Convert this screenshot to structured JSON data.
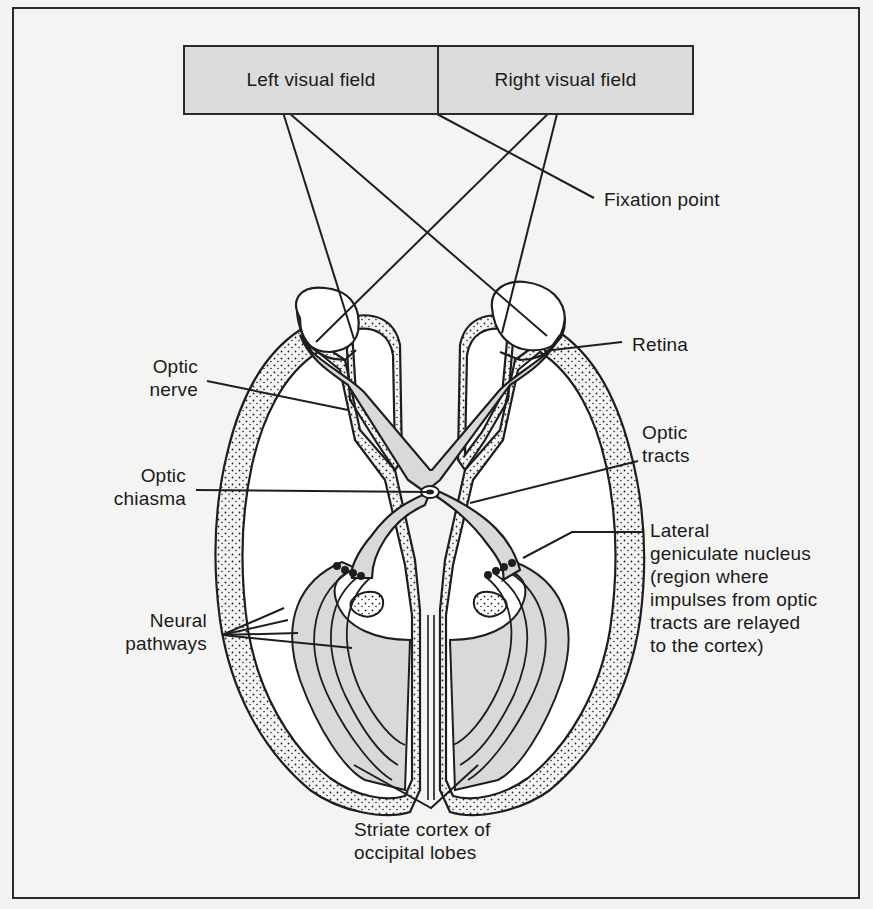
{
  "figure": {
    "visual_fields": {
      "left": "Left visual field",
      "right": "Right visual field"
    },
    "labels": {
      "fixation_point": "Fixation point",
      "retina": "Retina",
      "optic_nerve": "Optic\nnerve",
      "optic_chiasma": "Optic\nchiasma",
      "optic_tracts": "Optic\ntracts",
      "lateral_geniculate_nucleus": "Lateral\ngeniculate nucleus\n(region where\nimpulses from optic\ntracts are relayed\nto the cortex)",
      "neural_pathways": "Neural\npathways",
      "striate_cortex": "Striate cortex of\noccipital lobes"
    },
    "colors": {
      "background": "#f4f4f2",
      "line": "#1e1e1e",
      "field_fill": "#dcdcdc",
      "pathway_fill": "#d9d9d9",
      "brain_fill": "#ffffff"
    }
  }
}
